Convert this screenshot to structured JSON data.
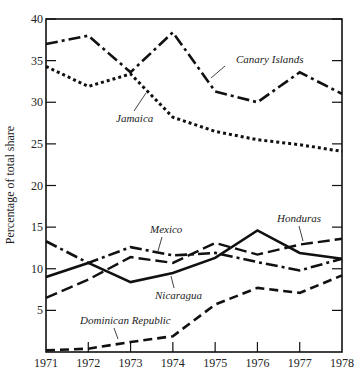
{
  "chart_data": {
    "type": "line",
    "title": "",
    "xlabel": "",
    "ylabel": "Percentage of total share",
    "x": [
      1971,
      1972,
      1973,
      1974,
      1975,
      1976,
      1977,
      1978
    ],
    "xlim": [
      1971,
      1978
    ],
    "ylim": [
      0,
      40
    ],
    "yticks": [
      5,
      10,
      15,
      20,
      25,
      30,
      35,
      40
    ],
    "grid": false,
    "legend": "none (direct line annotations)",
    "series": [
      {
        "name": "Canary Islands",
        "style": "dash-dot",
        "values": [
          37.0,
          38.0,
          33.6,
          38.4,
          31.3,
          30.0,
          33.6,
          31.0
        ]
      },
      {
        "name": "Jamaica",
        "style": "dotted",
        "values": [
          34.3,
          31.9,
          33.4,
          28.2,
          26.5,
          25.5,
          24.9,
          24.1
        ]
      },
      {
        "name": "Mexico",
        "style": "dash-dot",
        "values": [
          13.3,
          10.7,
          12.6,
          11.6,
          11.9,
          10.8,
          9.8,
          11.2
        ]
      },
      {
        "name": "Honduras",
        "style": "long-dash",
        "values": [
          6.5,
          8.7,
          11.4,
          10.7,
          13.1,
          11.7,
          12.9,
          13.6
        ]
      },
      {
        "name": "Nicaragua",
        "style": "solid",
        "values": [
          9.0,
          10.7,
          8.4,
          9.5,
          11.3,
          14.6,
          11.9,
          11.2
        ]
      },
      {
        "name": "Dominican Republic",
        "style": "dashed",
        "values": [
          0.2,
          0.4,
          1.2,
          1.9,
          5.7,
          7.7,
          7.1,
          9.2
        ]
      }
    ],
    "annotations": [
      {
        "text": "Canary Islands",
        "x": 1975.2,
        "y": 36.5
      },
      {
        "text": "Jamaica",
        "x": 1973.0,
        "y": 27.5
      },
      {
        "text": "Mexico",
        "x": 1974.0,
        "y": 14.5
      },
      {
        "text": "Honduras",
        "x": 1977.0,
        "y": 15.5
      },
      {
        "text": "Nicaragua",
        "x": 1974.0,
        "y": 7.0
      },
      {
        "text": "Dominican Republic",
        "x": 1972.7,
        "y": 4.0
      }
    ]
  },
  "labels": {
    "ylabel": "Percentage of total share",
    "xticks": [
      "1971",
      "1972",
      "1973",
      "1974",
      "1975",
      "1976",
      "1977",
      "1978"
    ],
    "yticks": [
      "5",
      "10",
      "15",
      "20",
      "25",
      "30",
      "35",
      "40"
    ],
    "canary": "Canary Islands",
    "jamaica": "Jamaica",
    "mexico": "Mexico",
    "honduras": "Honduras",
    "nicaragua": "Nicaragua",
    "dominican": "Dominican Republic"
  }
}
